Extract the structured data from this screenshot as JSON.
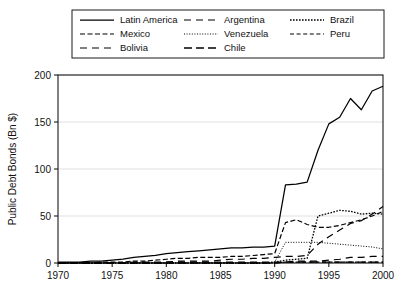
{
  "chart_data": {
    "type": "line",
    "title": "",
    "xlabel": "",
    "ylabel": "Public Debt Bonds (Bn $)",
    "xlim": [
      1970,
      2000
    ],
    "ylim": [
      0,
      200
    ],
    "xticks": [
      1970,
      1975,
      1980,
      1985,
      1990,
      1995,
      2000
    ],
    "yticks": [
      0,
      50,
      100,
      150,
      200
    ],
    "grid": true,
    "legend_position": "top",
    "x": [
      1970,
      1971,
      1972,
      1973,
      1974,
      1975,
      1976,
      1977,
      1978,
      1979,
      1980,
      1981,
      1982,
      1983,
      1984,
      1985,
      1986,
      1987,
      1988,
      1989,
      1990,
      1991,
      1992,
      1993,
      1994,
      1995,
      1996,
      1997,
      1998,
      1999,
      2000
    ],
    "series": [
      {
        "name": "Latin America",
        "style": "solid",
        "values": [
          1,
          1,
          1,
          2,
          2,
          3,
          4,
          6,
          7,
          8,
          10,
          11,
          12,
          13,
          14,
          15,
          16,
          16,
          17,
          17,
          18,
          83,
          84,
          86,
          120,
          148,
          155,
          175,
          163,
          183,
          188
        ]
      },
      {
        "name": "Mexico",
        "style": "dashed",
        "values": [
          0,
          0,
          0,
          0,
          1,
          1,
          1,
          2,
          2,
          3,
          4,
          5,
          5,
          6,
          6,
          6,
          7,
          7,
          8,
          9,
          10,
          43,
          46,
          41,
          38,
          38,
          40,
          43,
          46,
          50,
          55
        ]
      },
      {
        "name": "Bolivia",
        "style": "long-dash",
        "values": [
          0,
          0,
          0,
          0,
          0,
          0,
          0,
          1,
          1,
          1,
          1,
          2,
          2,
          2,
          2,
          3,
          4,
          4,
          5,
          5,
          6,
          7,
          7,
          8,
          20,
          28,
          35,
          42,
          45,
          52,
          60
        ]
      },
      {
        "name": "Argentina",
        "style": "dash-gap",
        "values": [
          0,
          0,
          0,
          0,
          0,
          0,
          0,
          0,
          0,
          0,
          1,
          1,
          1,
          1,
          1,
          1,
          1,
          1,
          1,
          1,
          1,
          1,
          2,
          2,
          2,
          3,
          4,
          6,
          6,
          7,
          7
        ]
      },
      {
        "name": "Venezuela",
        "style": "fine-dotted",
        "values": [
          0,
          0,
          0,
          0,
          0,
          0,
          0,
          0,
          0,
          0,
          0,
          0,
          0,
          0,
          0,
          0,
          0,
          0,
          0,
          0,
          1,
          22,
          22,
          22,
          22,
          21,
          20,
          19,
          18,
          17,
          15
        ]
      },
      {
        "name": "Chile",
        "style": "dash-dash",
        "values": [
          0,
          0,
          0,
          0,
          0,
          0,
          0,
          0,
          0,
          0,
          0,
          0,
          0,
          0,
          0,
          0,
          0,
          0,
          0,
          0,
          0,
          1,
          1,
          1,
          1,
          1,
          1,
          1,
          1,
          1,
          1
        ]
      },
      {
        "name": "Brazil",
        "style": "dotted",
        "values": [
          0,
          0,
          0,
          0,
          0,
          0,
          0,
          0,
          0,
          0,
          0,
          0,
          0,
          0,
          0,
          0,
          0,
          0,
          0,
          0,
          1,
          3,
          4,
          5,
          50,
          53,
          56,
          55,
          52,
          53,
          52
        ]
      },
      {
        "name": "Peru",
        "style": "short-dash",
        "values": [
          0,
          0,
          0,
          0,
          0,
          0,
          0,
          0,
          0,
          0,
          0,
          0,
          0,
          0,
          0,
          0,
          0,
          0,
          0,
          0,
          0,
          1,
          1,
          1,
          1,
          1,
          1,
          1,
          1,
          1,
          1
        ]
      }
    ]
  },
  "legend": {
    "items": [
      {
        "label": "Latin America",
        "style": "solid"
      },
      {
        "label": "Mexico",
        "style": "dashed"
      },
      {
        "label": "Bolivia",
        "style": "long-dash"
      },
      {
        "label": "Argentina",
        "style": "dash-gap"
      },
      {
        "label": "Venezuela",
        "style": "fine-dotted"
      },
      {
        "label": "Chile",
        "style": "dash-dash"
      },
      {
        "label": "Brazil",
        "style": "dotted"
      },
      {
        "label": "Peru",
        "style": "short-dash"
      }
    ]
  },
  "axis": {
    "y_title": "Public Debt Bonds (Bn $)",
    "y_ticks": [
      "0",
      "50",
      "100",
      "150",
      "200"
    ],
    "x_ticks": [
      "1970",
      "1975",
      "1980",
      "1985",
      "1990",
      "1995",
      "2000"
    ]
  },
  "colors": {
    "line": "#000000",
    "axis": "#1a1a1a",
    "grid": "#d8d8d8",
    "background": "#ffffff"
  }
}
